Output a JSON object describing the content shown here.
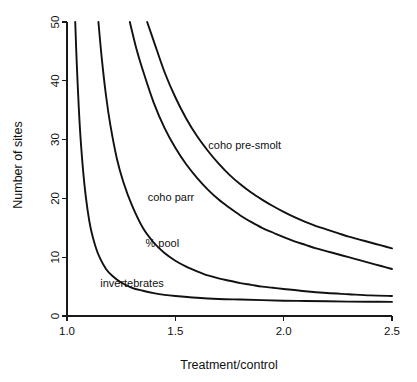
{
  "chart_data": {
    "type": "line",
    "title": "",
    "xlabel": "Treatment/control",
    "ylabel": "Number of sites",
    "xlim": [
      1.0,
      2.5
    ],
    "ylim": [
      0,
      50
    ],
    "grid": false,
    "legend_position": "inline-annotations",
    "xticks": [
      "1.0",
      "1.5",
      "2.0",
      "2.5"
    ],
    "xtick_values": [
      1.0,
      1.5,
      2.0,
      2.5
    ],
    "yticks": [
      "0",
      "10",
      "20",
      "30",
      "40",
      "50"
    ],
    "ytick_values": [
      0,
      10,
      20,
      30,
      40,
      50
    ],
    "series": [
      {
        "name": "coho pre-smolt",
        "label": "coho pre-smolt",
        "x": [
          1.37,
          1.4,
          1.45,
          1.5,
          1.55,
          1.6,
          1.65,
          1.7,
          1.75,
          1.8,
          1.85,
          1.9,
          1.95,
          2.0,
          2.05,
          2.1,
          2.15,
          2.2,
          2.25,
          2.3,
          2.35,
          2.4,
          2.45,
          2.5
        ],
        "values": [
          50.0,
          46.8,
          41.5,
          37.2,
          33.6,
          30.6,
          28.1,
          25.9,
          24.0,
          22.4,
          21.0,
          19.8,
          18.7,
          17.7,
          16.8,
          16.0,
          15.3,
          14.7,
          14.1,
          13.5,
          13.0,
          12.5,
          12.0,
          11.5
        ]
      },
      {
        "name": "coho parr",
        "label": "coho parr",
        "x": [
          1.29,
          1.32,
          1.35,
          1.4,
          1.45,
          1.5,
          1.55,
          1.6,
          1.65,
          1.7,
          1.75,
          1.8,
          1.85,
          1.9,
          1.95,
          2.0,
          2.05,
          2.1,
          2.15,
          2.2,
          2.25,
          2.3,
          2.35,
          2.4,
          2.45,
          2.5
        ],
        "values": [
          50.0,
          45.5,
          41.8,
          36.3,
          32.0,
          28.6,
          25.8,
          23.5,
          21.5,
          19.8,
          18.4,
          17.1,
          16.0,
          15.0,
          14.2,
          13.4,
          12.7,
          12.1,
          11.5,
          11.0,
          10.5,
          10.0,
          9.5,
          9.0,
          8.5,
          8.0
        ]
      },
      {
        "name": "% pool",
        "label": "% pool",
        "x": [
          1.145,
          1.16,
          1.18,
          1.2,
          1.23,
          1.26,
          1.3,
          1.35,
          1.4,
          1.45,
          1.5,
          1.55,
          1.6,
          1.65,
          1.7,
          1.75,
          1.8,
          1.85,
          1.9,
          1.95,
          2.0,
          2.1,
          2.2,
          2.3,
          2.4,
          2.5
        ],
        "values": [
          50.0,
          44.0,
          37.5,
          32.5,
          26.8,
          22.8,
          18.8,
          15.0,
          12.5,
          10.7,
          9.4,
          8.4,
          7.6,
          6.9,
          6.4,
          6.0,
          5.6,
          5.3,
          5.0,
          4.8,
          4.6,
          4.2,
          3.9,
          3.7,
          3.5,
          3.4
        ]
      },
      {
        "name": "invertebrates",
        "label": "invertebrates",
        "x": [
          1.038,
          1.045,
          1.055,
          1.065,
          1.08,
          1.095,
          1.11,
          1.13,
          1.15,
          1.18,
          1.21,
          1.25,
          1.3,
          1.35,
          1.4,
          1.45,
          1.5,
          1.6,
          1.7,
          1.8,
          1.9,
          2.0,
          2.1,
          2.2,
          2.3,
          2.4,
          2.5
        ],
        "values": [
          50.0,
          43.0,
          35.0,
          29.0,
          22.5,
          18.0,
          14.8,
          12.0,
          10.0,
          8.0,
          6.8,
          5.7,
          4.8,
          4.3,
          3.9,
          3.6,
          3.4,
          3.1,
          2.9,
          2.8,
          2.7,
          2.6,
          2.55,
          2.5,
          2.45,
          2.42,
          2.4
        ]
      }
    ],
    "annotations": [
      {
        "text": "coho pre-smolt",
        "x": 1.82,
        "y": 29.0
      },
      {
        "text": "coho parr",
        "x": 1.48,
        "y": 20.3
      },
      {
        "text": "% pool",
        "x": 1.44,
        "y": 12.4
      },
      {
        "text": "invertebrates",
        "x": 1.3,
        "y": 5.6
      }
    ],
    "colors": {
      "curve": "#111111",
      "axis": "#1a1a1a",
      "background": "#ffffff",
      "text": "#111111"
    }
  }
}
